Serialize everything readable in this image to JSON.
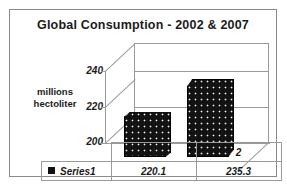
{
  "chart_data": {
    "type": "bar",
    "title": "Global Consumption - 2002 & 2007",
    "categories": [
      "1",
      "2"
    ],
    "series": [
      {
        "name": "Series1",
        "values": [
          220.1,
          235.3
        ]
      }
    ],
    "values": [
      220.1,
      235.3
    ],
    "value_labels": [
      "220.1",
      "235.3"
    ],
    "xlabel": "",
    "ylabel": "millions hectoliter",
    "ylabel_line1": "millions",
    "ylabel_line2": "hectoliter",
    "ylim": [
      200,
      245
    ],
    "yticks": [
      200,
      220,
      240
    ],
    "ytick_labels": [
      "200",
      "220",
      "240"
    ],
    "grid": true,
    "legend": "bottom-table",
    "legend_entries": [
      "Series1"
    ],
    "three_d": true,
    "bar_color": "#121212",
    "grid_color": "#9a9a9a",
    "frame_color": "#8a8a8a",
    "text_color": "#1b1b1b",
    "data_table": {
      "header_row": [
        "",
        "1",
        "2"
      ],
      "rows": [
        {
          "label": "Series1",
          "cells": [
            "220.1",
            "235.3"
          ]
        }
      ]
    }
  }
}
